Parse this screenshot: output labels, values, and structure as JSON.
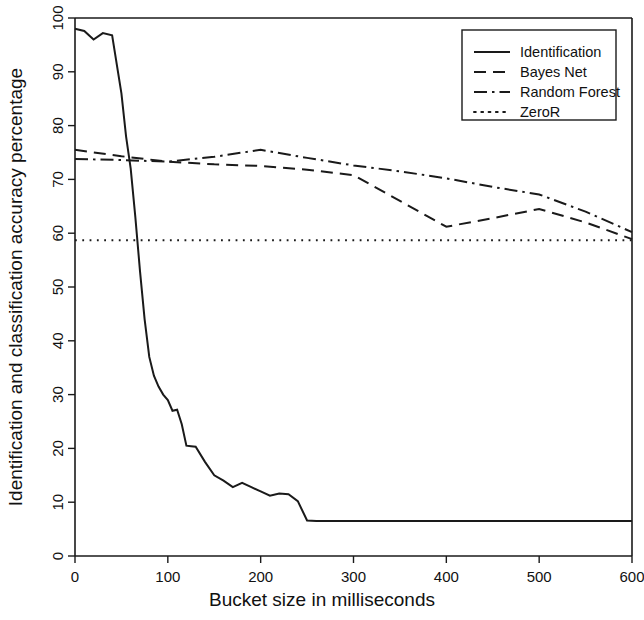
{
  "chart_data": {
    "type": "line",
    "title": "",
    "xlabel": "Bucket size in milliseconds",
    "ylabel": "Identification and classification accuracy percentage",
    "xlim": [
      0,
      600
    ],
    "ylim": [
      0,
      100
    ],
    "xticks": [
      0,
      100,
      200,
      300,
      400,
      500,
      600
    ],
    "yticks": [
      0,
      10,
      20,
      30,
      40,
      50,
      60,
      70,
      80,
      90,
      100
    ],
    "grid": false,
    "legend_position": "top-right",
    "series": [
      {
        "name": "Identification",
        "style": "solid",
        "x": [
          0,
          10,
          20,
          30,
          40,
          50,
          55,
          60,
          65,
          70,
          75,
          80,
          85,
          90,
          95,
          100,
          105,
          110,
          115,
          120,
          125,
          130,
          140,
          150,
          160,
          170,
          180,
          190,
          200,
          210,
          220,
          230,
          240,
          250,
          260,
          300,
          350,
          400,
          450,
          500,
          550,
          600
        ],
        "y": [
          98.0,
          97.6,
          96.0,
          97.2,
          96.8,
          86.0,
          78.0,
          72.0,
          63.0,
          53.0,
          44.0,
          37.0,
          33.5,
          31.5,
          30.0,
          29.0,
          27.0,
          27.2,
          24.5,
          20.5,
          20.4,
          20.3,
          17.5,
          15.0,
          14.0,
          12.8,
          13.6,
          12.8,
          12.0,
          11.2,
          11.6,
          11.5,
          10.2,
          6.6,
          6.5,
          6.5,
          6.5,
          6.5,
          6.5,
          6.5,
          6.5,
          6.5
        ]
      },
      {
        "name": "Bayes Net",
        "style": "dashed",
        "x": [
          0,
          50,
          100,
          150,
          200,
          250,
          300,
          350,
          400,
          450,
          500,
          550,
          600
        ],
        "y": [
          75.5,
          74.3,
          73.3,
          72.8,
          72.5,
          71.8,
          70.8,
          66.0,
          61.2,
          62.8,
          64.5,
          62.0,
          58.9
        ]
      },
      {
        "name": "Random Forest",
        "style": "dashdot",
        "x": [
          0,
          50,
          100,
          150,
          200,
          250,
          300,
          350,
          400,
          450,
          500,
          550,
          600
        ],
        "y": [
          73.8,
          73.6,
          73.3,
          74.2,
          75.5,
          74.0,
          72.6,
          71.5,
          70.2,
          68.6,
          67.2,
          64.0,
          60.2
        ]
      },
      {
        "name": "ZeroR",
        "style": "dotted",
        "x": [
          0,
          600
        ],
        "y": [
          58.7,
          58.7
        ]
      }
    ]
  },
  "legend": {
    "entries": [
      {
        "label": "Identification",
        "style": "solid"
      },
      {
        "label": "Bayes Net",
        "style": "dashed"
      },
      {
        "label": "Random Forest",
        "style": "dashdot"
      },
      {
        "label": "ZeroR",
        "style": "dotted"
      }
    ]
  },
  "colors": {
    "ink": "#1a1a1a",
    "background": "#ffffff"
  }
}
